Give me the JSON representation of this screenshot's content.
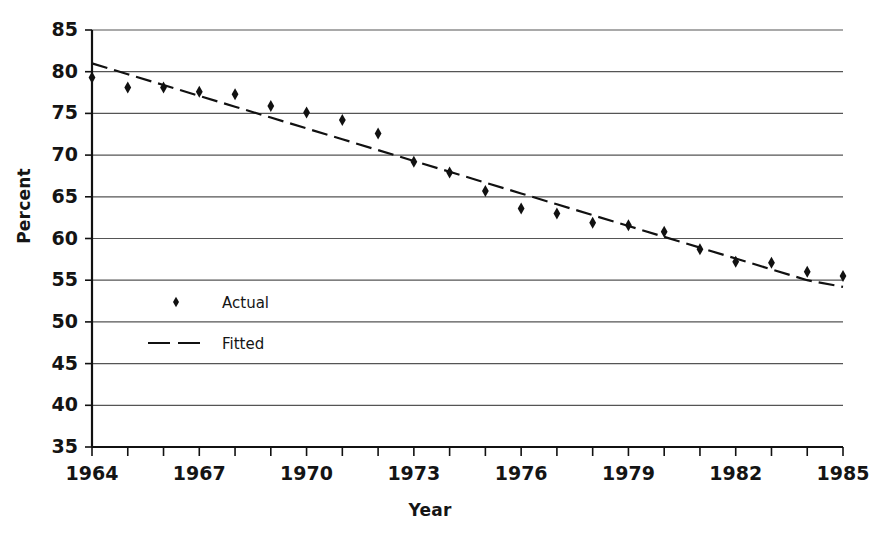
{
  "chart_data": {
    "type": "line",
    "title": "",
    "xlabel": "Year",
    "ylabel": "Percent",
    "xlim": [
      1964,
      1985
    ],
    "ylim": [
      35,
      85
    ],
    "grid": true,
    "legend_position": "inside-left",
    "x": [
      1964,
      1965,
      1966,
      1967,
      1968,
      1969,
      1970,
      1971,
      1972,
      1973,
      1974,
      1975,
      1976,
      1977,
      1978,
      1979,
      1980,
      1981,
      1982,
      1983,
      1984,
      1985
    ],
    "xticks": [
      1964,
      1965,
      1966,
      1967,
      1968,
      1969,
      1970,
      1971,
      1972,
      1973,
      1974,
      1975,
      1976,
      1977,
      1978,
      1979,
      1980,
      1981,
      1982,
      1983,
      1984,
      1985
    ],
    "xtick_labels": [
      "1964",
      "",
      "",
      "1967",
      "",
      "",
      "1970",
      "",
      "",
      "1973",
      "",
      "",
      "1976",
      "",
      "",
      "1979",
      "",
      "",
      "1982",
      "",
      "",
      "1985"
    ],
    "yticks": [
      35,
      40,
      45,
      50,
      55,
      60,
      65,
      70,
      75,
      80,
      85
    ],
    "ytick_labels": [
      "35",
      "40",
      "45",
      "50",
      "55",
      "60",
      "65",
      "70",
      "75",
      "80",
      "85"
    ],
    "series": [
      {
        "name": "Actual",
        "marker": "diamond",
        "style": "markers",
        "values": [
          79.3,
          78.1,
          78.1,
          77.6,
          77.3,
          75.9,
          75.1,
          74.2,
          72.6,
          69.2,
          67.9,
          65.7,
          63.6,
          63.0,
          61.9,
          61.6,
          60.8,
          58.7,
          57.2,
          57.1,
          56.0,
          55.5
        ]
      },
      {
        "name": "Fitted",
        "marker": "none",
        "style": "dashed-line",
        "values": [
          81.0,
          79.7,
          78.4,
          77.1,
          75.8,
          74.5,
          73.2,
          71.9,
          70.6,
          69.3,
          68.0,
          66.7,
          65.4,
          64.1,
          62.8,
          61.5,
          60.2,
          58.9,
          57.6,
          56.3,
          55.0,
          54.2
        ]
      }
    ],
    "legend": [
      {
        "label": "Actual",
        "symbol": "diamond-marker"
      },
      {
        "label": "Fitted",
        "symbol": "dashed-line"
      }
    ],
    "colors": {
      "data": "#111111",
      "grid": "#555555",
      "axis": "#111111",
      "background": "#ffffff"
    }
  }
}
